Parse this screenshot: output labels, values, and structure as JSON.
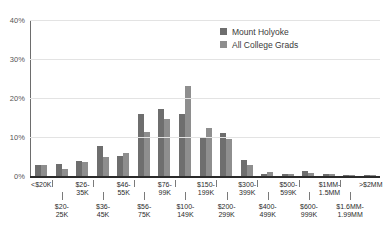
{
  "chart_data": {
    "type": "bar",
    "title": "",
    "subtitle": "",
    "xlabel": "",
    "ylabel": "",
    "ylim": [
      0,
      40
    ],
    "yticks": [
      "0%",
      "10%",
      "20%",
      "30%",
      "40%"
    ],
    "ytick_values": [
      0,
      10,
      20,
      30,
      40
    ],
    "grid": true,
    "legend_position": "top-right",
    "categories": [
      "<$20K",
      "$20-\n25K",
      "$26-\n35K",
      "$36-\n45K",
      "$46-\n55K",
      "$56-\n75K",
      "$76-\n99K",
      "$100-\n149K",
      "$150-\n199K",
      "$200-\n299K",
      "$300-\n399K",
      "$400-\n499K",
      "$500-\n599K",
      "$600-\n999K",
      "$1MM-\n1.5MM",
      "$1.6MM-\n1.99MM",
      ">$2MM"
    ],
    "series": [
      {
        "name": "Mount Holyoke",
        "color": "#6e6e6e",
        "values": [
          2.9,
          3.0,
          3.8,
          7.8,
          5.1,
          15.9,
          17.3,
          16.0,
          9.7,
          11.0,
          4.1,
          0.5,
          0.5,
          1.2,
          0.5,
          0.1,
          0.1
        ]
      },
      {
        "name": "All College Grads",
        "color": "#8e8e8e",
        "values": [
          2.9,
          1.7,
          3.6,
          4.9,
          5.9,
          11.2,
          14.7,
          23.0,
          12.3,
          9.4,
          2.9,
          1.1,
          0.6,
          0.9,
          0.4,
          0.2,
          0.3
        ]
      }
    ]
  },
  "legend": {
    "items": [
      {
        "label": "Mount Holyoke",
        "color": "#6e6e6e"
      },
      {
        "label": "All College Grads",
        "color": "#8e8e8e"
      }
    ]
  },
  "axis": {
    "y_ticks": [
      {
        "label": "40%",
        "value": 40
      },
      {
        "label": "30%",
        "value": 30
      },
      {
        "label": "20%",
        "value": 20
      },
      {
        "label": "10%",
        "value": 10
      },
      {
        "label": "0%",
        "value": 0
      }
    ]
  }
}
